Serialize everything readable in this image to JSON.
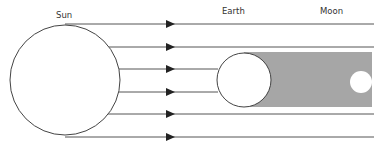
{
  "labels": {
    "sun": "Sun",
    "earth": "Earth",
    "moon": "Moon"
  },
  "bodies": {
    "sun": {
      "cx": 65,
      "cy": 80,
      "r": 55
    },
    "earth": {
      "cx": 244,
      "cy": 80,
      "r": 27
    },
    "moon": {
      "cx": 361,
      "cy": 82,
      "r": 11
    }
  },
  "shadow": {
    "x": 244,
    "y": 52,
    "width": 128,
    "height": 55,
    "color": "#a6a6a6"
  },
  "rays": [
    {
      "y": 24,
      "x1": 65,
      "x2": 374
    },
    {
      "y": 47,
      "x1": 108,
      "x2": 374
    },
    {
      "y": 69,
      "x1": 119,
      "x2": 218
    },
    {
      "y": 92,
      "x1": 119,
      "x2": 218
    },
    {
      "y": 114,
      "x1": 108,
      "x2": 374
    },
    {
      "y": 137,
      "x1": 65,
      "x2": 374
    }
  ],
  "arrow_x": 170,
  "colors": {
    "line": "#555555",
    "outline": "#444444",
    "fill": "#ffffff"
  }
}
